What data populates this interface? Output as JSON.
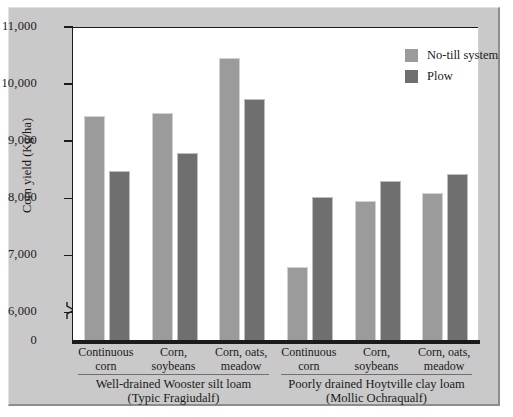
{
  "chart_data": {
    "type": "bar",
    "title": "",
    "xlabel": "",
    "ylabel": "Corn yield (Kg/ha)",
    "ylim": [
      5500,
      11000
    ],
    "axis_break": true,
    "grid": false,
    "legend_position": "top-right",
    "yticks": [
      "11,000",
      "10,000",
      "9,000",
      "8,000",
      "7,000",
      "6,000",
      "0"
    ],
    "ytick_values": [
      11000,
      10000,
      9000,
      8000,
      7000,
      6000,
      0
    ],
    "categories": [
      "Continuous\ncorn",
      "Corn,\nsoybeans",
      "Corn, oats,\nmeadow",
      "Continuous\ncorn",
      "Corn,\nsoybeans",
      "Corn, oats,\nmeadow"
    ],
    "category_lines": [
      [
        "Continuous",
        "corn"
      ],
      [
        "Corn,",
        "soybeans"
      ],
      [
        "Corn, oats,",
        "meadow"
      ],
      [
        "Continuous",
        "corn"
      ],
      [
        "Corn,",
        "soybeans"
      ],
      [
        "Corn, oats,",
        "meadow"
      ]
    ],
    "groups": [
      {
        "lines": [
          "Well-drained Wooster silt loam",
          "(Typic Fragiudalf)"
        ]
      },
      {
        "lines": [
          "Poorly drained Hoytville clay loam",
          "(Mollic Ochraqualf)"
        ]
      }
    ],
    "series": [
      {
        "name": "No-till system",
        "color": "#9b9b9b",
        "values": [
          9440,
          9500,
          10460,
          6800,
          7960,
          8100
        ]
      },
      {
        "name": "Plow",
        "color": "#6f6f6f",
        "values": [
          8470,
          8790,
          9740,
          8030,
          8310,
          8430
        ]
      }
    ]
  },
  "colors": {
    "figure_background": "#c9c9c9",
    "plot_background": "#ffffff",
    "axis": "#1b1b1b",
    "no_till": "#9b9b9b",
    "plow": "#6f6f6f"
  }
}
